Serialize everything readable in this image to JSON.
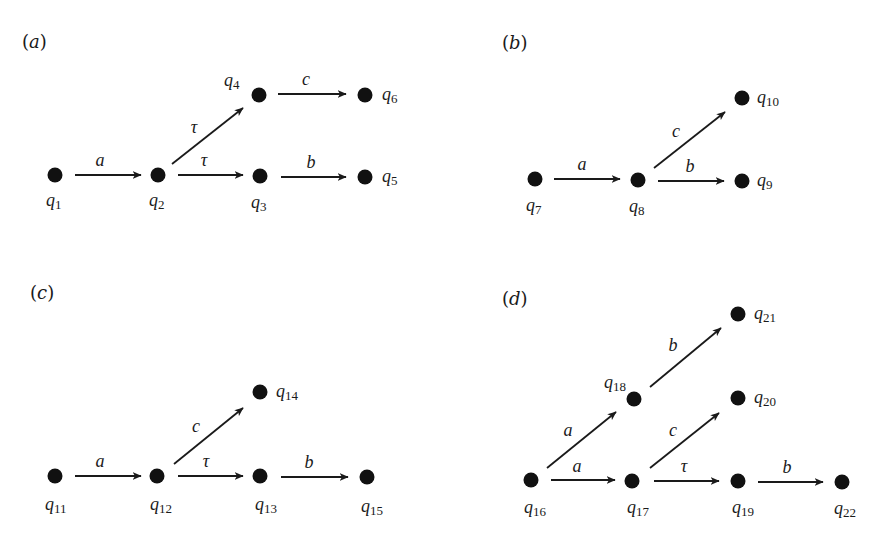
{
  "figure": {
    "colors": {
      "ink": "#111111",
      "background": "#ffffff"
    },
    "panels": [
      {
        "id": "a",
        "label": "(a)",
        "label_pos": [
          22,
          48
        ],
        "nodes": [
          {
            "id": "q1",
            "name": "q",
            "sub": "1",
            "x": 55,
            "y": 175,
            "lx": 46,
            "ly": 206
          },
          {
            "id": "q2",
            "name": "q",
            "sub": "2",
            "x": 158,
            "y": 175,
            "lx": 149,
            "ly": 206
          },
          {
            "id": "q3",
            "name": "q",
            "sub": "3",
            "x": 260,
            "y": 176,
            "lx": 251,
            "ly": 208
          },
          {
            "id": "q4",
            "name": "q",
            "sub": "4",
            "x": 259,
            "y": 95,
            "lx": 224,
            "ly": 86
          },
          {
            "id": "q5",
            "name": "q",
            "sub": "5",
            "x": 365,
            "y": 177,
            "lx": 382,
            "ly": 182
          },
          {
            "id": "q6",
            "name": "q",
            "sub": "6",
            "x": 365,
            "y": 95,
            "lx": 382,
            "ly": 100
          }
        ],
        "edges": [
          {
            "from": "q1",
            "to": "q2",
            "label": "a",
            "x1": 75,
            "y1": 175,
            "x2": 141,
            "y2": 175,
            "lx": 100,
            "ly": 166
          },
          {
            "from": "q2",
            "to": "q4",
            "label": "τ",
            "x1": 172,
            "y1": 164,
            "x2": 243,
            "y2": 108,
            "lx": 194,
            "ly": 133
          },
          {
            "from": "q2",
            "to": "q3",
            "label": "τ",
            "x1": 178,
            "y1": 175,
            "x2": 243,
            "y2": 175,
            "lx": 204,
            "ly": 166
          },
          {
            "from": "q4",
            "to": "q6",
            "label": "c",
            "x1": 278,
            "y1": 94,
            "x2": 346,
            "y2": 94,
            "lx": 306,
            "ly": 85
          },
          {
            "from": "q3",
            "to": "q5",
            "label": "b",
            "x1": 281,
            "y1": 177,
            "x2": 346,
            "y2": 177,
            "lx": 311,
            "ly": 168
          }
        ]
      },
      {
        "id": "b",
        "label": "(b)",
        "label_pos": [
          502,
          49
        ],
        "nodes": [
          {
            "id": "q7",
            "name": "q",
            "sub": "7",
            "x": 535,
            "y": 179,
            "lx": 526,
            "ly": 211
          },
          {
            "id": "q8",
            "name": "q",
            "sub": "8",
            "x": 638,
            "y": 180,
            "lx": 629,
            "ly": 212
          },
          {
            "id": "q9",
            "name": "q",
            "sub": "9",
            "x": 742,
            "y": 181,
            "lx": 757,
            "ly": 186
          },
          {
            "id": "q10",
            "name": "q",
            "sub": "10",
            "x": 742,
            "y": 98,
            "lx": 757,
            "ly": 103
          }
        ],
        "edges": [
          {
            "from": "q7",
            "to": "q8",
            "label": "a",
            "x1": 554,
            "y1": 179,
            "x2": 620,
            "y2": 179,
            "lx": 582,
            "ly": 170
          },
          {
            "from": "q8",
            "to": "q10",
            "label": "c",
            "x1": 654,
            "y1": 168,
            "x2": 725,
            "y2": 112,
            "lx": 676,
            "ly": 137
          },
          {
            "from": "q8",
            "to": "q9",
            "label": "b",
            "x1": 658,
            "y1": 181,
            "x2": 724,
            "y2": 181,
            "lx": 690,
            "ly": 172
          }
        ]
      },
      {
        "id": "c",
        "label": "(c)",
        "label_pos": [
          30,
          299
        ],
        "nodes": [
          {
            "id": "q11",
            "name": "q",
            "sub": "11",
            "x": 55,
            "y": 476,
            "lx": 45,
            "ly": 510
          },
          {
            "id": "q12",
            "name": "q",
            "sub": "12",
            "x": 157,
            "y": 476,
            "lx": 150,
            "ly": 510
          },
          {
            "id": "q13",
            "name": "q",
            "sub": "13",
            "x": 260,
            "y": 476,
            "lx": 255,
            "ly": 510
          },
          {
            "id": "q14",
            "name": "q",
            "sub": "14",
            "x": 260,
            "y": 392,
            "lx": 276,
            "ly": 397
          },
          {
            "id": "q15",
            "name": "q",
            "sub": "15",
            "x": 367,
            "y": 477,
            "lx": 361,
            "ly": 512
          }
        ],
        "edges": [
          {
            "from": "q11",
            "to": "q12",
            "label": "a",
            "x1": 75,
            "y1": 476,
            "x2": 141,
            "y2": 476,
            "lx": 100,
            "ly": 467
          },
          {
            "from": "q12",
            "to": "q14",
            "label": "c",
            "x1": 174,
            "y1": 464,
            "x2": 243,
            "y2": 408,
            "lx": 196,
            "ly": 432
          },
          {
            "from": "q12",
            "to": "q13",
            "label": "τ",
            "x1": 178,
            "y1": 476,
            "x2": 243,
            "y2": 476,
            "lx": 206,
            "ly": 467
          },
          {
            "from": "q13",
            "to": "q15",
            "label": "b",
            "x1": 281,
            "y1": 477,
            "x2": 348,
            "y2": 477,
            "lx": 309,
            "ly": 468
          }
        ]
      },
      {
        "id": "d",
        "label": "(d)",
        "label_pos": [
          502,
          305
        ],
        "nodes": [
          {
            "id": "q16",
            "name": "q",
            "sub": "16",
            "x": 531,
            "y": 480,
            "lx": 524,
            "ly": 513
          },
          {
            "id": "q17",
            "name": "q",
            "sub": "17",
            "x": 632,
            "y": 481,
            "lx": 627,
            "ly": 513
          },
          {
            "id": "q18",
            "name": "q",
            "sub": "18",
            "x": 634,
            "y": 399,
            "lx": 604,
            "ly": 388
          },
          {
            "id": "q19",
            "name": "q",
            "sub": "19",
            "x": 738,
            "y": 481,
            "lx": 732,
            "ly": 513
          },
          {
            "id": "q20",
            "name": "q",
            "sub": "20",
            "x": 738,
            "y": 398,
            "lx": 754,
            "ly": 403
          },
          {
            "id": "q21",
            "name": "q",
            "sub": "21",
            "x": 738,
            "y": 314,
            "lx": 754,
            "ly": 319
          },
          {
            "id": "q22",
            "name": "q",
            "sub": "22",
            "x": 842,
            "y": 482,
            "lx": 834,
            "ly": 514
          }
        ],
        "edges": [
          {
            "from": "q16",
            "to": "q18",
            "label": "a",
            "x1": 547,
            "y1": 468,
            "x2": 616,
            "y2": 412,
            "lx": 568,
            "ly": 436
          },
          {
            "from": "q16",
            "to": "q17",
            "label": "a",
            "x1": 551,
            "y1": 480,
            "x2": 615,
            "y2": 480,
            "lx": 577,
            "ly": 472
          },
          {
            "from": "q18",
            "to": "q21",
            "label": "b",
            "x1": 650,
            "y1": 387,
            "x2": 721,
            "y2": 328,
            "lx": 673,
            "ly": 351
          },
          {
            "from": "q17",
            "to": "q20",
            "label": "c",
            "x1": 650,
            "y1": 468,
            "x2": 719,
            "y2": 413,
            "lx": 673,
            "ly": 436
          },
          {
            "from": "q17",
            "to": "q19",
            "label": "τ",
            "x1": 654,
            "y1": 481,
            "x2": 719,
            "y2": 481,
            "lx": 684,
            "ly": 472
          },
          {
            "from": "q19",
            "to": "q22",
            "label": "b",
            "x1": 758,
            "y1": 482,
            "x2": 823,
            "y2": 482,
            "lx": 787,
            "ly": 473
          }
        ]
      }
    ]
  }
}
